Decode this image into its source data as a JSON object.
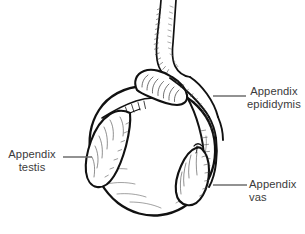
{
  "figure": {
    "background_color": "#ffffff",
    "ink_color": "#111111",
    "leader_color": "#6e6e6e",
    "text_color": "#3b3b3b"
  },
  "labels": {
    "appendix_epididymis": {
      "line1": "Appendix",
      "line2": "epididymis"
    },
    "appendix_testis": {
      "line1": "Appendix",
      "line2": "testis"
    },
    "appendix_vas": {
      "line1": "Appendix",
      "line2": "vas"
    }
  },
  "structures": [
    {
      "name": "spermatic-cord"
    },
    {
      "name": "testis-body"
    },
    {
      "name": "epididymis-head"
    },
    {
      "name": "epididymis-body"
    },
    {
      "name": "appendix-testis-lobe"
    },
    {
      "name": "appendix-vas-lobe"
    },
    {
      "name": "vas-deferens"
    }
  ]
}
